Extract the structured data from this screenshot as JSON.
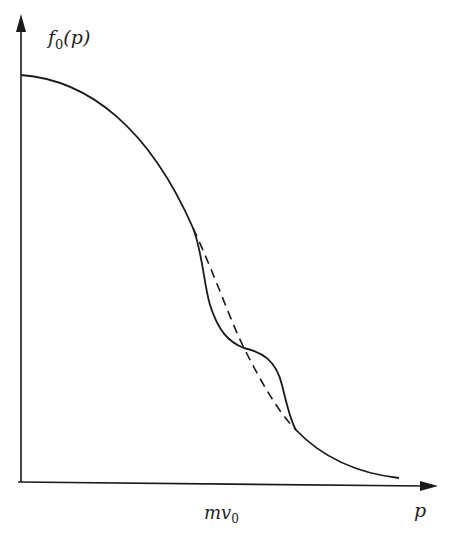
{
  "figure": {
    "y_axis_label": "f",
    "y_axis_label_sub": "0",
    "y_axis_label_arg": "(p)",
    "x_axis_label": "p",
    "x_tick_label": "mv",
    "x_tick_label_sub": "0",
    "colors": {
      "line": "#1a1a1a",
      "background": "#ffffff"
    },
    "curves": [
      {
        "name": "unperturbed-distribution",
        "style": "solid+dashed",
        "description": "Smooth monotonically decreasing distribution (dashed through the perturbed region)"
      },
      {
        "name": "perturbed-distribution",
        "style": "solid",
        "description": "Distribution with a plateau/bump near p = mv0"
      }
    ]
  }
}
